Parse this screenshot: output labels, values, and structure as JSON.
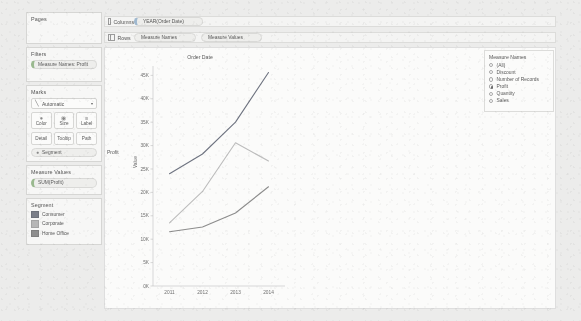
{
  "app": {
    "name": "tableau-worksheet"
  },
  "left_panel": {
    "pages": {
      "title": "Pages"
    },
    "filters": {
      "title": "Filters",
      "items": [
        "Measure Names: Profit"
      ]
    },
    "marks": {
      "title": "Marks",
      "type_selector": {
        "label": "Automatic",
        "icon": "line-chart-icon",
        "arrow": "▾"
      },
      "buttons": [
        {
          "label": "Color",
          "icon": "color-icon"
        },
        {
          "label": "Size",
          "icon": "size-icon"
        },
        {
          "label": "Label",
          "icon": "label-icon"
        },
        {
          "label": "Detail",
          "icon": "detail-icon"
        },
        {
          "label": "Tooltip",
          "icon": "tooltip-icon"
        },
        {
          "label": "Path",
          "icon": "path-icon"
        }
      ],
      "encodings": [
        {
          "label": "Segment",
          "icon": "color-icon"
        }
      ]
    },
    "measure_values": {
      "title": "Measure Values",
      "items": [
        "SUM(Profit)"
      ]
    },
    "segment_legend": {
      "title": "Segment",
      "items": [
        {
          "label": "Consumer",
          "color": "#7b7f89"
        },
        {
          "label": "Corporate",
          "color": "#b6b6b6"
        },
        {
          "label": "Home Office",
          "color": "#8e8e8e"
        }
      ]
    }
  },
  "shelves": {
    "columns": {
      "label": "Columns",
      "pills": [
        "YEAR(Order Date)"
      ]
    },
    "rows": {
      "label": "Rows",
      "pills": [
        "Measure Names",
        "Measure Values"
      ]
    }
  },
  "filter_card": {
    "title": "Measure Names",
    "options": [
      {
        "label": "(All)",
        "selected": false
      },
      {
        "label": "Discount",
        "selected": false
      },
      {
        "label": "Number of Records",
        "selected": false
      },
      {
        "label": "Profit",
        "selected": true
      },
      {
        "label": "Quantity",
        "selected": false
      },
      {
        "label": "Sales",
        "selected": false
      }
    ]
  },
  "chart_data": {
    "type": "line",
    "title": "Order Date",
    "row_label": "Profit",
    "xlabel": "",
    "ylabel": "Value",
    "categories": [
      "2011",
      "2012",
      "2013",
      "2014"
    ],
    "yticks": [
      "0K",
      "5K",
      "10K",
      "15K",
      "20K",
      "25K",
      "30K",
      "35K",
      "40K",
      "45K"
    ],
    "ytick_values": [
      0,
      5000,
      10000,
      15000,
      20000,
      25000,
      30000,
      35000,
      40000,
      45000
    ],
    "ylim": [
      0,
      47000
    ],
    "grid": false,
    "legend_position": "left-panel",
    "series": [
      {
        "name": "Consumer",
        "color": "#6e7380",
        "values": [
          24000,
          28200,
          35000,
          45600
        ]
      },
      {
        "name": "Corporate",
        "color": "#bcbcbc",
        "values": [
          13500,
          20200,
          30600,
          26700
        ]
      },
      {
        "name": "Home Office",
        "color": "#8c8c8c",
        "values": [
          11600,
          12600,
          15600,
          21200
        ]
      }
    ]
  }
}
